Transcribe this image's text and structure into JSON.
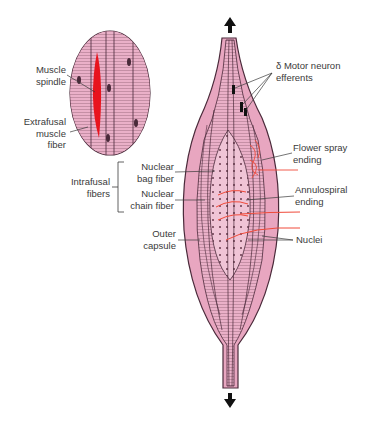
{
  "diagram": {
    "colors": {
      "fiber_pink": "#e8a6c0",
      "fiber_pink_light": "#f0c4d6",
      "outline": "#4a2a3a",
      "spindle_red": "#e8141e",
      "nerve_red": "#f04a3a",
      "arrow": "#111111",
      "text": "#3a3a3a"
    },
    "inset": {
      "labels": {
        "muscle_spindle": [
          "Muscle",
          "spindle"
        ],
        "extrafusal": [
          "Extrafusal",
          "muscle",
          "fiber"
        ]
      }
    },
    "left_labels": {
      "intrafusal": [
        "Intrafusal",
        "fibers"
      ],
      "nuclear_bag": [
        "Nuclear",
        "bag fiber"
      ],
      "nuclear_chain": [
        "Nuclear",
        "chain fiber"
      ],
      "outer_capsule": [
        "Outer",
        "capsule"
      ]
    },
    "right_labels": {
      "motor_neuron": [
        "δ Motor neuron",
        "efferents"
      ],
      "flower_spray": [
        "Flower spray",
        "ending"
      ],
      "annulospiral": [
        "Annulospiral",
        "ending"
      ],
      "nuclei": [
        "Nuclei"
      ]
    },
    "arrows": {
      "top": "up-arrow",
      "bottom": "down-arrow"
    }
  }
}
